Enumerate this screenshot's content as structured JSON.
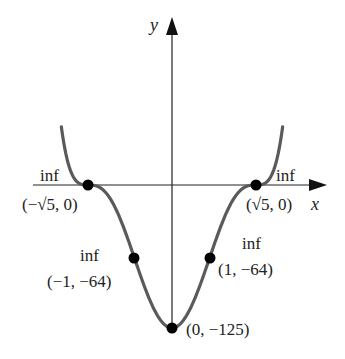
{
  "chart_data": {
    "type": "line",
    "title": "",
    "function": "y = (x^2 - 5)^3",
    "xlabel": "x",
    "ylabel": "y",
    "grid": false,
    "legend": null,
    "x_range": [
      -2.95,
      2.95
    ],
    "series": [
      {
        "name": "curve",
        "color": "#555555",
        "points": [
          {
            "x": -2.95,
            "y": 61.6
          },
          {
            "x": -2.5,
            "y": 1.95
          },
          {
            "x": -2.236,
            "y": 0
          },
          {
            "x": -2.0,
            "y": -1
          },
          {
            "x": -1.5,
            "y": -19.5
          },
          {
            "x": -1.0,
            "y": -64
          },
          {
            "x": -0.5,
            "y": -107.2
          },
          {
            "x": 0.0,
            "y": -125
          },
          {
            "x": 0.5,
            "y": -107.2
          },
          {
            "x": 1.0,
            "y": -64
          },
          {
            "x": 1.5,
            "y": -19.5
          },
          {
            "x": 2.0,
            "y": -1
          },
          {
            "x": 2.236,
            "y": 0
          },
          {
            "x": 2.5,
            "y": 1.95
          },
          {
            "x": 2.95,
            "y": 61.6
          }
        ]
      }
    ],
    "annotations": [
      {
        "tag": "inf",
        "label": "(−√5, 0)",
        "x": -2.236,
        "y": 0
      },
      {
        "tag": "inf",
        "label": "(√5, 0)",
        "x": 2.236,
        "y": 0
      },
      {
        "tag": "inf",
        "label": "(−1, −64)",
        "x": -1,
        "y": -64
      },
      {
        "tag": "inf",
        "label": "(1, −64)",
        "x": 1,
        "y": -64
      },
      {
        "tag": "",
        "label": "(0, −125)",
        "x": 0,
        "y": -125
      }
    ]
  },
  "labels": {
    "x_axis": "x",
    "y_axis": "y",
    "inf": "inf",
    "p_neg_root": "(−√5, 0)",
    "p_pos_root": "(√5, 0)",
    "p_neg_one": "(−1, −64)",
    "p_pos_one": "(1, −64)",
    "p_min": "(0, −125)"
  }
}
